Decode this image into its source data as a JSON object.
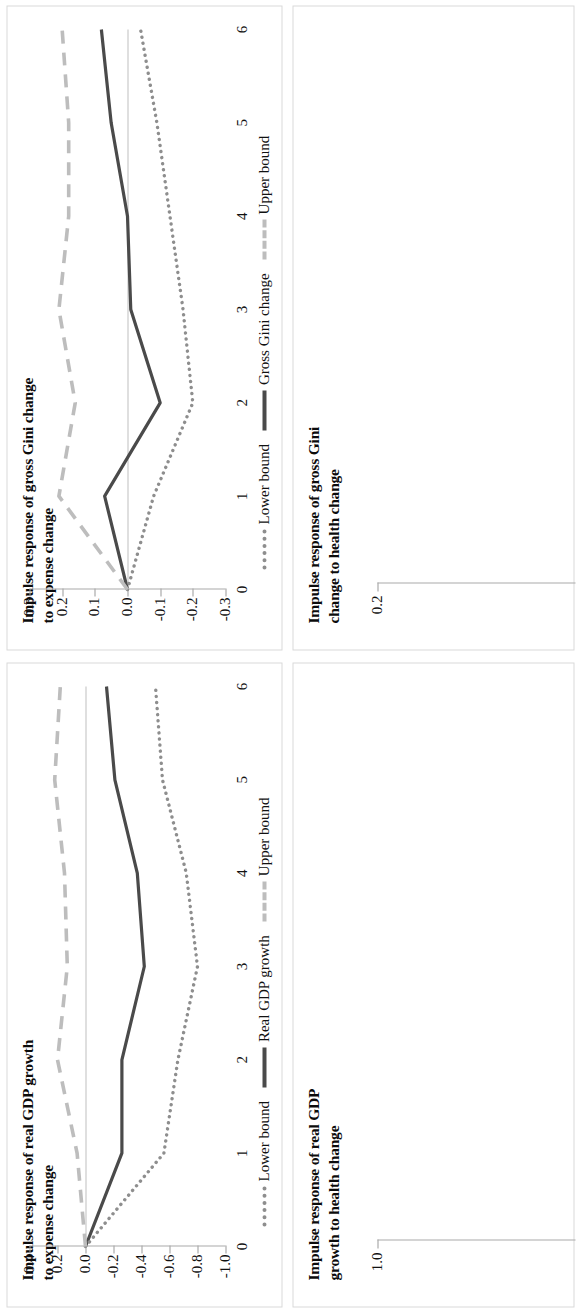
{
  "figure": {
    "orientation": "rotated-90-ccw",
    "background": "#ffffff",
    "panel_border_color": "#d9d9d9"
  },
  "colors": {
    "point_estimate": "#4a4a4a",
    "lower_bound": "#8e8e8e",
    "upper_bound": "#bdbdbd",
    "axis": "#a9a9a9",
    "text": "#111111"
  },
  "legend": {
    "lower_label": "Lower bound",
    "upper_label": "Upper bound",
    "center_label_gini": "Gross Gini change",
    "center_label_gdp": "Real GDP growth"
  },
  "panels": {
    "gini_expense": {
      "title_line1": "Impulse response of gross Gini change",
      "title_line2": "to expense change",
      "center_series_label": "Gross Gini change"
    },
    "gdp_expense": {
      "title_line1": "Impulse response of real GDP growth",
      "title_line2": "to expense change",
      "center_series_label": "Real GDP growth"
    },
    "gini_health": {
      "title_line1": "Impulse response of gross Gini",
      "title_line2": "change to health change",
      "first_tick": "0.2"
    },
    "gdp_health": {
      "title_line1": "Impulse response of real GDP",
      "title_line2": "growth to health change",
      "first_tick": "1.0"
    }
  },
  "chart_data": [
    {
      "id": "gdp_expense",
      "type": "line",
      "title": "Impulse response of real GDP growth to expense change",
      "xlabel": "",
      "ylabel": "",
      "x": [
        0,
        1,
        2,
        3,
        4,
        5,
        6
      ],
      "xticklabels": [
        "0",
        "1",
        "2",
        "3",
        "4",
        "5",
        "6"
      ],
      "yticklabels": [
        "0.4",
        "0.2",
        "0.0",
        "-0.2",
        "-0.4",
        "-0.6",
        "-0.8",
        "-1.0"
      ],
      "ytickvalues": [
        0.4,
        0.2,
        0.0,
        -0.2,
        -0.4,
        -0.6,
        -0.8,
        -1.0
      ],
      "ylim": [
        -1.0,
        0.4
      ],
      "xlim": [
        0,
        6
      ],
      "grid": false,
      "legend_position": "bottom",
      "series": [
        {
          "name": "Real GDP growth",
          "style": "solid",
          "values": [
            0.0,
            -0.26,
            -0.26,
            -0.42,
            -0.37,
            -0.21,
            -0.15
          ]
        },
        {
          "name": "Lower bound",
          "style": "dotted",
          "values": [
            0.0,
            -0.56,
            -0.66,
            -0.8,
            -0.72,
            -0.55,
            -0.5
          ]
        },
        {
          "name": "Upper bound",
          "style": "dashed",
          "values": [
            0.0,
            0.06,
            0.2,
            0.13,
            0.15,
            0.22,
            0.18
          ]
        }
      ]
    },
    {
      "id": "gini_expense",
      "type": "line",
      "title": "Impulse response of gross Gini change to expense change",
      "xlabel": "",
      "ylabel": "",
      "x": [
        0,
        1,
        2,
        3,
        4,
        5,
        6
      ],
      "xticklabels": [
        "0",
        "1",
        "2",
        "3",
        "4",
        "5",
        "6"
      ],
      "yticklabels": [
        "0.3",
        "0.2",
        "0.1",
        "0.0",
        "-0.1",
        "-0.2",
        "-0.3"
      ],
      "ytickvalues": [
        0.3,
        0.2,
        0.1,
        0.0,
        -0.1,
        -0.2,
        -0.3
      ],
      "ylim": [
        -0.3,
        0.3
      ],
      "xlim": [
        0,
        6
      ],
      "grid": false,
      "legend_position": "bottom",
      "series": [
        {
          "name": "Gross Gini change",
          "style": "solid",
          "values": [
            0.0,
            0.07,
            -0.1,
            -0.01,
            0.0,
            0.05,
            0.08
          ]
        },
        {
          "name": "Lower bound",
          "style": "dotted",
          "values": [
            0.0,
            -0.08,
            -0.2,
            -0.17,
            -0.13,
            -0.09,
            -0.04
          ]
        },
        {
          "name": "Upper bound",
          "style": "dashed",
          "values": [
            0.0,
            0.21,
            0.16,
            0.21,
            0.18,
            0.18,
            0.2
          ]
        }
      ]
    },
    {
      "id": "gdp_health",
      "type": "line",
      "title": "Impulse response of real GDP growth to health change",
      "yticklabels": [
        "1.0"
      ],
      "partial": true
    },
    {
      "id": "gini_health",
      "type": "line",
      "title": "Impulse response of gross Gini change to health change",
      "yticklabels": [
        "0.2"
      ],
      "partial": true
    }
  ]
}
